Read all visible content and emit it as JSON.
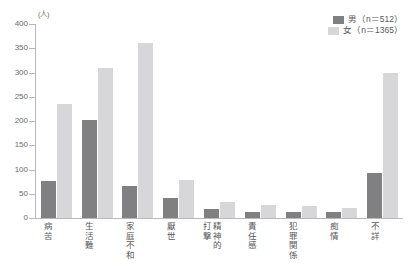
{
  "chart_data": {
    "type": "bar",
    "title": "",
    "subtitle": "",
    "xlabel": "",
    "ylabel": "(人)",
    "ylim": [
      0,
      400
    ],
    "ytick_step": 50,
    "yticks": [
      "400",
      "350",
      "300",
      "250",
      "200",
      "150",
      "100",
      "50",
      "0"
    ],
    "grid": false,
    "legend_position": "top-right",
    "categories": [
      "病苦",
      "生活難",
      "家庭不和",
      "厭世",
      "精神的打撃",
      "責任感",
      "犯罪関係",
      "痴情",
      "不詳"
    ],
    "category_columns": [
      [
        "病苦"
      ],
      [
        "生活難"
      ],
      [
        "家庭不和"
      ],
      [
        "厭世"
      ],
      [
        "精神的",
        "打撃"
      ],
      [
        "責任感"
      ],
      [
        "犯罪関係"
      ],
      [
        "痴情"
      ],
      [
        "不詳"
      ]
    ],
    "series": [
      {
        "name": "男",
        "legend_label": "男（n＝512）",
        "n": 512,
        "color": "#808083",
        "values": [
          76,
          202,
          67,
          42,
          19,
          13,
          13,
          12,
          92
        ]
      },
      {
        "name": "女",
        "legend_label": "女（n＝1365）",
        "n": 1365,
        "color": "#d7d7d9",
        "values": [
          235,
          309,
          360,
          78,
          34,
          27,
          25,
          21,
          298
        ]
      }
    ]
  },
  "axis": {
    "unit_label": "(人)",
    "line_color": "#b9b9bb"
  },
  "legend": {
    "items": [
      {
        "label": "男（n＝512）",
        "color": "#808083"
      },
      {
        "label": "女（n＝1365）",
        "color": "#d7d7d9"
      }
    ]
  }
}
